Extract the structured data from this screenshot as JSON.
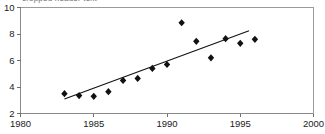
{
  "caption": {
    "clipped_text": "cropped header text"
  },
  "chart_data": {
    "type": "scatter",
    "title": "",
    "subtitle": "",
    "xlabel": "",
    "ylabel": "",
    "xlim": [
      1980,
      2000
    ],
    "ylim": [
      2,
      10
    ],
    "xticks": [
      1980,
      1985,
      1990,
      1995,
      2000
    ],
    "yticks": [
      2,
      4,
      6,
      8,
      10
    ],
    "xtick_labels": [
      "1980",
      "1985",
      "1990",
      "1995",
      "2000"
    ],
    "ytick_labels": [
      "2",
      "4",
      "6",
      "8",
      "10"
    ],
    "grid": false,
    "legend": null,
    "marker": "diamond",
    "marker_color": "#111111",
    "series": [
      {
        "name": "observations",
        "x": [
          1983,
          1984,
          1985,
          1986,
          1987,
          1988,
          1989,
          1990,
          1991,
          1992,
          1993,
          1994,
          1995,
          1996
        ],
        "values": [
          3.5,
          3.35,
          3.3,
          3.65,
          4.5,
          4.65,
          5.4,
          5.7,
          8.85,
          7.45,
          6.2,
          7.65,
          7.3,
          7.6
        ]
      }
    ],
    "trend_line": {
      "name": "linear fit",
      "x": [
        1983,
        1995.6
      ],
      "y": [
        3.1,
        8.25
      ],
      "color": "#111111"
    }
  }
}
